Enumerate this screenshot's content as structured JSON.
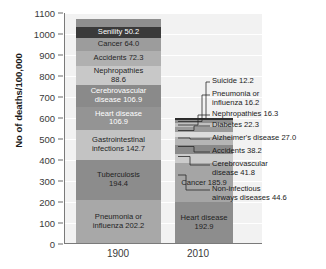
{
  "chart_data": {
    "type": "bar",
    "title": "",
    "subtitle": "",
    "xlabel": "",
    "ylabel": "No of deaths/100,000",
    "categories": [
      "1900",
      "2010"
    ],
    "ylim": [
      0,
      1100
    ],
    "yticks": [
      0,
      100,
      200,
      300,
      400,
      500,
      600,
      700,
      800,
      900,
      1000,
      1100
    ],
    "grid": true,
    "legend": "none",
    "stacked": true,
    "note": "Stacked bar chart of leading causes of death per 100,000 population, 1900 vs 2010. Segments ordered bottom-to-top within each bar.",
    "series": [
      {
        "name": "Pneumonia or influenza",
        "values": [
          202.2,
          16.2
        ]
      },
      {
        "name": "Tuberculosis",
        "values": [
          194.4,
          0
        ]
      },
      {
        "name": "Gastrointestinal infections",
        "values": [
          142.7,
          0
        ]
      },
      {
        "name": "Heart disease",
        "values": [
          106.9,
          192.9
        ]
      },
      {
        "name": "Cerebrovascular disease",
        "values": [
          106.9,
          41.8
        ]
      },
      {
        "name": "Nephropathies",
        "values": [
          88.6,
          16.3
        ]
      },
      {
        "name": "Accidents",
        "values": [
          72.3,
          38.2
        ]
      },
      {
        "name": "Cancer",
        "values": [
          64.0,
          185.9
        ]
      },
      {
        "name": "Senility",
        "values": [
          50.2,
          0
        ]
      },
      {
        "name": "Diphtheria",
        "values": [
          40.3,
          0
        ]
      },
      {
        "name": "Non-infectious airways diseases",
        "values": [
          0,
          44.6
        ]
      },
      {
        "name": "Alzheimer's disease",
        "values": [
          0,
          27.0
        ]
      },
      {
        "name": "Diabetes",
        "values": [
          0,
          22.3
        ]
      },
      {
        "name": "Suicide",
        "values": [
          0,
          12.2
        ]
      }
    ],
    "bars": [
      {
        "category": "1900",
        "total": 1068.5,
        "segments": [
          {
            "label": "Pneumonia or\ninfluenza 202.2",
            "name": "Pneumonia or influenza",
            "value": 202.2,
            "color": "#a8a8a8",
            "text": "dark"
          },
          {
            "label": "Tuberculosis\n194.4",
            "name": "Tuberculosis",
            "value": 194.4,
            "color": "#8c8c8c",
            "text": "dark"
          },
          {
            "label": "Gastrointestinal\ninfections 142.7",
            "name": "Gastrointestinal infections",
            "value": 142.7,
            "color": "#c3c3c3",
            "text": "dark"
          },
          {
            "label": "Heart disease\n106.9",
            "name": "Heart disease",
            "value": 106.9,
            "color": "#949494",
            "text": "light"
          },
          {
            "label": "Cerebrovascular\ndisease 106.9",
            "name": "Cerebrovascular disease",
            "value": 106.9,
            "color": "#8a8a8a",
            "text": "light"
          },
          {
            "label": "Nephropathies\n88.6",
            "name": "Nephropathies",
            "value": 88.6,
            "color": "#c8c8c8",
            "text": "dark"
          },
          {
            "label": "Accidents 72.3",
            "name": "Accidents",
            "value": 72.3,
            "color": "#b0b0b0",
            "text": "dark"
          },
          {
            "label": "Cancer 64.0",
            "name": "Cancer",
            "value": 64.0,
            "color": "#9c9c9c",
            "text": "dark"
          },
          {
            "label": "Senility 50.2",
            "name": "Senility",
            "value": 50.2,
            "color": "#3a3a3a",
            "text": "light"
          },
          {
            "label": "Diphtheria 40.3",
            "name": "Diphtheria",
            "value": 40.3,
            "color": "#8f8f8f",
            "text": "light"
          }
        ]
      },
      {
        "category": "2010",
        "total": 597.4,
        "segments": [
          {
            "label": "Heart disease\n192.9",
            "name": "Heart disease",
            "value": 192.9,
            "color": "#8d8d8d",
            "text": "dark"
          },
          {
            "label": "Cancer 185.9",
            "name": "Cancer",
            "value": 185.9,
            "color": "#a5a5a5",
            "text": "dark"
          },
          {
            "label": "",
            "name": "Non-infectious airways diseases",
            "value": 44.6,
            "color": "#cbcbcb",
            "text": "dark"
          },
          {
            "label": "",
            "name": "Cerebrovascular disease",
            "value": 41.8,
            "color": "#8a8a8a",
            "text": "dark"
          },
          {
            "label": "",
            "name": "Accidents",
            "value": 38.2,
            "color": "#b5b5b5",
            "text": "dark"
          },
          {
            "label": "",
            "name": "Alzheimer's disease",
            "value": 27.0,
            "color": "#dcdcdc",
            "text": "dark"
          },
          {
            "label": "",
            "name": "Diabetes",
            "value": 22.3,
            "color": "#9a9a9a",
            "text": "dark"
          },
          {
            "label": "",
            "name": "Nephropathies",
            "value": 16.3,
            "color": "#c0c0c0",
            "text": "dark"
          },
          {
            "label": "",
            "name": "Pneumonia or influenza",
            "value": 16.2,
            "color": "#8f8f8f",
            "text": "dark"
          },
          {
            "label": "",
            "name": "Suicide",
            "value": 12.2,
            "color": "#2f2f2f",
            "text": "light"
          }
        ]
      }
    ],
    "callouts": [
      {
        "text": "Suicide 12.2",
        "value": 12.2
      },
      {
        "text": "Pneumonia or\ninfluenza 16.2",
        "value": 16.2
      },
      {
        "text": "Nephropathies 16.3",
        "value": 16.3
      },
      {
        "text": "Diabetes 22.3",
        "value": 22.3
      },
      {
        "text": "Alzheimer's disease 27.0",
        "value": 27.0
      },
      {
        "text": "Accidents 38.2",
        "value": 38.2
      },
      {
        "text": "Cerebrovascular\ndisease 41.8",
        "value": 41.8
      },
      {
        "text": "Non-infectious\nairways diseases 44.6",
        "value": 44.6
      }
    ]
  }
}
